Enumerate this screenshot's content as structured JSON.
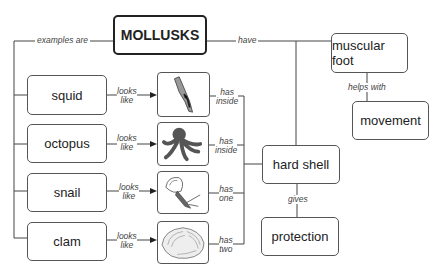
{
  "diagram": {
    "title": "MOLLUSKS",
    "nodes": {
      "root": "MOLLUSKS",
      "squid": "squid",
      "octopus": "octopus",
      "snail": "snail",
      "clam": "clam",
      "muscular_foot": "muscular foot",
      "movement": "movement",
      "hard_shell": "hard shell",
      "protection": "protection"
    },
    "images": {
      "squid": "squid-illustration",
      "octopus": "octopus-illustration",
      "snail": "snail-illustration",
      "clam": "clam-illustration"
    },
    "edges": {
      "examples_are": "examples are",
      "have": "have",
      "helps_with": "helps with",
      "gives": "gives",
      "squid_looks": [
        "looks",
        "like"
      ],
      "octopus_looks": [
        "looks",
        "like"
      ],
      "snail_looks": [
        "looks",
        "like"
      ],
      "clam_looks": [
        "looks",
        "like"
      ],
      "squid_has": [
        "has",
        "inside"
      ],
      "octopus_has": [
        "has",
        "inside"
      ],
      "snail_has": [
        "has",
        "one"
      ],
      "clam_has": [
        "has",
        "two"
      ]
    }
  }
}
